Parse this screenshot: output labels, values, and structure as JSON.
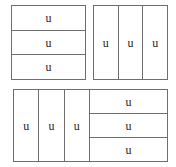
{
  "figure": {
    "unit_label": "u",
    "stroke_color": "#6e6e6e",
    "text_color": "#222222",
    "background_color": "#ffffff",
    "panels": [
      {
        "id": "top-left",
        "name": "three-horizontal-rows",
        "orientation": "rows",
        "part_count": 3,
        "cells": [
          {
            "label": "u"
          },
          {
            "label": "u"
          },
          {
            "label": "u"
          }
        ]
      },
      {
        "id": "top-right",
        "name": "three-vertical-columns",
        "orientation": "columns",
        "part_count": 3,
        "cells": [
          {
            "label": "u"
          },
          {
            "label": "u"
          },
          {
            "label": "u"
          }
        ]
      },
      {
        "id": "bottom-left",
        "name": "three-vertical-columns",
        "orientation": "columns",
        "part_count": 3,
        "cells": [
          {
            "label": "u"
          },
          {
            "label": "u"
          },
          {
            "label": "u"
          }
        ]
      },
      {
        "id": "bottom-right",
        "name": "three-horizontal-rows",
        "orientation": "rows",
        "part_count": 3,
        "cells": [
          {
            "label": "u"
          },
          {
            "label": "u"
          },
          {
            "label": "u"
          }
        ]
      }
    ]
  }
}
